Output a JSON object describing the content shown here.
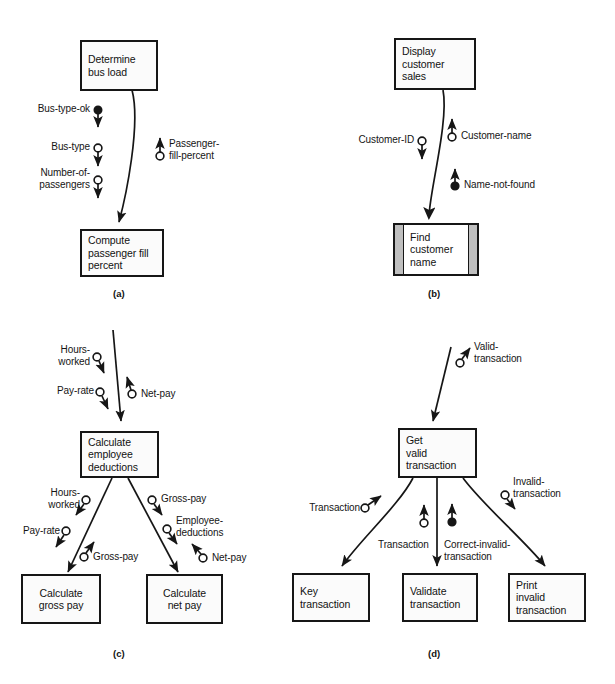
{
  "figure": {
    "type": "structure-chart-set",
    "panels": [
      "a",
      "b",
      "c",
      "d"
    ]
  },
  "captions": {
    "a": "(a)",
    "b": "(b)",
    "c": "(c)",
    "d": "(d)"
  },
  "panel_a": {
    "caption": "(a)",
    "modules": [
      {
        "id": "determine-bus-load",
        "label": "Determine\nbus load",
        "kind": "process"
      },
      {
        "id": "compute-passenger-fill-percent",
        "label": "Compute\npassenger fill\npercent",
        "kind": "process"
      }
    ],
    "couples": [
      {
        "name": "Bus-type-ok",
        "type": "control",
        "direction": "down"
      },
      {
        "name": "Bus-type",
        "type": "data",
        "direction": "down"
      },
      {
        "name": "Number-of-\npassengers",
        "type": "data",
        "direction": "down"
      },
      {
        "name": "Passenger-\nfill-percent",
        "type": "data",
        "direction": "up"
      }
    ]
  },
  "panel_b": {
    "caption": "(b)",
    "modules": [
      {
        "id": "display-customer-sales",
        "label": "Display\ncustomer\nsales",
        "kind": "process"
      },
      {
        "id": "find-customer-name",
        "label": "Find\ncustomer\nname",
        "kind": "library"
      }
    ],
    "couples": [
      {
        "name": "Customer-ID",
        "type": "data",
        "direction": "down"
      },
      {
        "name": "Customer-name",
        "type": "data",
        "direction": "up"
      },
      {
        "name": "Name-not-found",
        "type": "control",
        "direction": "up"
      }
    ]
  },
  "panel_c": {
    "caption": "(c)",
    "modules": [
      {
        "id": "calculate-employee-deductions",
        "label": "Calculate\nemployee\ndeductions",
        "kind": "process"
      },
      {
        "id": "calculate-gross-pay",
        "label": "Calculate\ngross pay",
        "kind": "process"
      },
      {
        "id": "calculate-net-pay",
        "label": "Calculate\nnet pay",
        "kind": "process"
      }
    ],
    "couples": [
      {
        "name": "Hours-\nworked",
        "type": "data",
        "direction": "down",
        "edge": "top"
      },
      {
        "name": "Pay-rate",
        "type": "data",
        "direction": "down",
        "edge": "top"
      },
      {
        "name": "Net-pay",
        "type": "data",
        "direction": "up",
        "edge": "top"
      },
      {
        "name": "Hours-\nworked",
        "type": "data",
        "direction": "down",
        "edge": "left"
      },
      {
        "name": "Pay-rate",
        "type": "data",
        "direction": "down",
        "edge": "left"
      },
      {
        "name": "Gross-pay",
        "type": "data",
        "direction": "up",
        "edge": "left"
      },
      {
        "name": "Gross-pay",
        "type": "data",
        "direction": "down",
        "edge": "right"
      },
      {
        "name": "Employee-\ndeductions",
        "type": "data",
        "direction": "down",
        "edge": "right"
      },
      {
        "name": "Net-pay",
        "type": "data",
        "direction": "up",
        "edge": "right"
      }
    ]
  },
  "panel_d": {
    "caption": "(d)",
    "modules": [
      {
        "id": "get-valid-transaction",
        "label": "Get\nvalid\ntransaction",
        "kind": "process"
      },
      {
        "id": "key-transaction",
        "label": "Key\ntransaction",
        "kind": "process"
      },
      {
        "id": "validate-transaction",
        "label": "Validate\ntransaction",
        "kind": "process"
      },
      {
        "id": "print-invalid-transaction",
        "label": "Print\ninvalid\ntransaction",
        "kind": "process"
      }
    ],
    "couples": [
      {
        "name": "Valid-\ntransaction",
        "type": "data",
        "direction": "up",
        "edge": "top"
      },
      {
        "name": "Transaction",
        "type": "data",
        "direction": "up",
        "edge": "left"
      },
      {
        "name": "Transaction",
        "type": "data",
        "direction": "up",
        "edge": "middle"
      },
      {
        "name": "Correct-invalid-\ntransaction",
        "type": "control",
        "direction": "up",
        "edge": "middle"
      },
      {
        "name": "Invalid-\ntransaction",
        "type": "data",
        "direction": "down",
        "edge": "right"
      }
    ]
  },
  "colors": {
    "line": "#161616",
    "box_fill": "#fbfbfb",
    "library_bar": "#bfbfbf",
    "background": "#ffffff",
    "text": "#121212"
  }
}
